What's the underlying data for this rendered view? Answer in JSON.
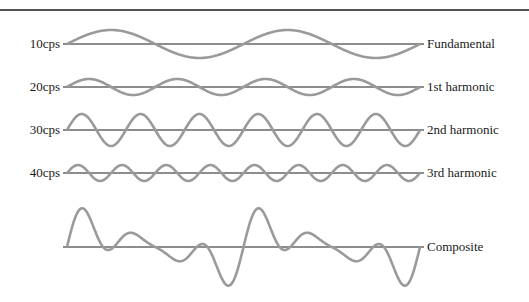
{
  "diagram": {
    "colors": {
      "wave": "#9a9a9a",
      "baseline": "#1a1a1a",
      "rule": "#1a1a1a"
    },
    "rows": [
      {
        "freq_label": "10cps",
        "name_label": "Fundamental",
        "baseline_y": 44,
        "amplitude": 14,
        "cycles": 2
      },
      {
        "freq_label": "20cps",
        "name_label": "1st harmonic",
        "baseline_y": 87,
        "amplitude": 8,
        "cycles": 4
      },
      {
        "freq_label": "30cps",
        "name_label": "2nd harmonic",
        "baseline_y": 130,
        "amplitude": 16,
        "cycles": 6
      },
      {
        "freq_label": "40cps",
        "name_label": "3rd harmonic",
        "baseline_y": 173,
        "amplitude": 8,
        "cycles": 8
      }
    ],
    "composite": {
      "name_label": "Composite",
      "baseline_y": 247
    },
    "x_start": 67,
    "x_end": 420
  }
}
